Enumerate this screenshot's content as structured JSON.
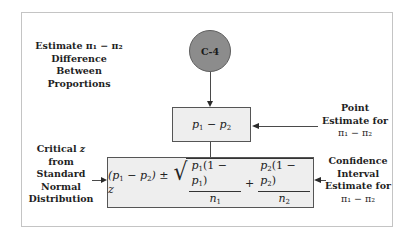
{
  "diagram": {
    "node_id": "C-4",
    "top_left_label": {
      "line1_prefix": "Estimate ",
      "line1_math": "π₁ − π₂",
      "line2": "Difference Between",
      "line3": "Proportions"
    },
    "point_estimate_box": {
      "formula": "p₁ − p₂"
    },
    "point_estimate_label": {
      "line1": "Point",
      "line2": "Estimate for",
      "line3": "π₁ − π₂"
    },
    "critical_z_label": {
      "line1": "Critical z",
      "line2": "from Standard",
      "line3": "Normal",
      "line4": "Distribution"
    },
    "interval_box": {
      "formula_text": "(p₁ − p₂) ± z √( p₁(1 − p₁)/n₁ + p₂(1 − p₂)/n₂ )",
      "left_term": "(p₁ − p₂) ± z",
      "frac1_num": "p₁(1 − p₁)",
      "frac1_den": "n₁",
      "frac2_num": "p₂(1 − p₂)",
      "frac2_den": "n₂",
      "plus": "+"
    },
    "confidence_label": {
      "line1": "Confidence",
      "line2": "Interval",
      "line3": "Estimate for",
      "line4": "π₁ − π₂"
    },
    "colors": {
      "circle_fill": "#8c8c8c",
      "box_fill": "#eeeeee",
      "frame_border": "#c4c4c4"
    }
  }
}
